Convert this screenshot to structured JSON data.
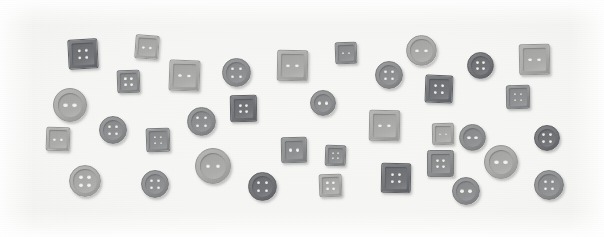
{
  "scene": {
    "title": "Assorted sewing buttons on white background",
    "width": 604,
    "height": 237,
    "background_color": "#fdfdfd",
    "surface_color": "#f6f6f4",
    "description": "Flat-lay photograph of 36 grey plastic sewing buttons, mixed round and square, each with two or four holes, scattered across a plain white surface."
  },
  "palette": {
    "dark_grey": "#6f7174",
    "mid_grey": "#8d8f90",
    "light_grey": "#a9aaa9",
    "pale_grey": "#b9b9b7",
    "hole_color": "#f2f2f0",
    "shadow": "rgba(90,90,88,0.34)"
  },
  "legend": {
    "shapes": [
      "round",
      "square"
    ],
    "hole_counts": [
      2,
      4
    ],
    "total_buttons": 36
  },
  "buttons": [
    {
      "id": "btn-01",
      "shape": "square",
      "holes": 4,
      "x": 68,
      "y": 39,
      "size": 30,
      "tone": "dark",
      "rotate": -3
    },
    {
      "id": "btn-02",
      "shape": "square",
      "holes": 2,
      "x": 135,
      "y": 35,
      "size": 24,
      "tone": "light",
      "rotate": 4
    },
    {
      "id": "btn-03",
      "shape": "square",
      "holes": 4,
      "x": 117,
      "y": 70,
      "size": 23,
      "tone": "mid",
      "rotate": -2
    },
    {
      "id": "btn-04",
      "shape": "square",
      "holes": 2,
      "x": 169,
      "y": 60,
      "size": 31,
      "tone": "light",
      "rotate": 2
    },
    {
      "id": "btn-05",
      "shape": "round",
      "holes": 4,
      "x": 222,
      "y": 58,
      "size": 29,
      "tone": "mid",
      "rotate": 0
    },
    {
      "id": "btn-06",
      "shape": "square",
      "holes": 2,
      "x": 277,
      "y": 50,
      "size": 31,
      "tone": "light",
      "rotate": 1
    },
    {
      "id": "btn-07",
      "shape": "square",
      "holes": 2,
      "x": 335,
      "y": 42,
      "size": 22,
      "tone": "mid",
      "rotate": -2
    },
    {
      "id": "btn-08",
      "shape": "round",
      "holes": 2,
      "x": 406,
      "y": 35,
      "size": 31,
      "tone": "light",
      "rotate": 0
    },
    {
      "id": "btn-09",
      "shape": "round",
      "holes": 4,
      "x": 375,
      "y": 61,
      "size": 28,
      "tone": "mid",
      "rotate": 0
    },
    {
      "id": "btn-10",
      "shape": "round",
      "holes": 4,
      "x": 467,
      "y": 52,
      "size": 27,
      "tone": "dark",
      "rotate": 0
    },
    {
      "id": "btn-11",
      "shape": "square",
      "holes": 2,
      "x": 519,
      "y": 44,
      "size": 31,
      "tone": "light",
      "rotate": -1
    },
    {
      "id": "btn-12",
      "shape": "square",
      "holes": 4,
      "x": 425,
      "y": 75,
      "size": 28,
      "tone": "dark",
      "rotate": 2
    },
    {
      "id": "btn-13",
      "shape": "square",
      "holes": 4,
      "x": 506,
      "y": 85,
      "size": 24,
      "tone": "mid",
      "rotate": -1
    },
    {
      "id": "btn-14",
      "shape": "round",
      "holes": 2,
      "x": 53,
      "y": 88,
      "size": 34,
      "tone": "light",
      "rotate": 0
    },
    {
      "id": "btn-15",
      "shape": "round",
      "holes": 4,
      "x": 187,
      "y": 107,
      "size": 29,
      "tone": "mid",
      "rotate": 0
    },
    {
      "id": "btn-16",
      "shape": "square",
      "holes": 4,
      "x": 230,
      "y": 95,
      "size": 27,
      "tone": "dark",
      "rotate": -1
    },
    {
      "id": "btn-17",
      "shape": "round",
      "holes": 2,
      "x": 310,
      "y": 90,
      "size": 26,
      "tone": "mid",
      "rotate": 0
    },
    {
      "id": "btn-18",
      "shape": "round",
      "holes": 4,
      "x": 99,
      "y": 116,
      "size": 28,
      "tone": "mid",
      "rotate": 0
    },
    {
      "id": "btn-19",
      "shape": "square",
      "holes": 2,
      "x": 46,
      "y": 127,
      "size": 24,
      "tone": "light",
      "rotate": 2
    },
    {
      "id": "btn-20",
      "shape": "square",
      "holes": 4,
      "x": 146,
      "y": 128,
      "size": 24,
      "tone": "mid",
      "rotate": -2
    },
    {
      "id": "btn-21",
      "shape": "square",
      "holes": 2,
      "x": 369,
      "y": 110,
      "size": 31,
      "tone": "light",
      "rotate": 1
    },
    {
      "id": "btn-22",
      "shape": "square",
      "holes": 2,
      "x": 432,
      "y": 123,
      "size": 22,
      "tone": "light",
      "rotate": -1
    },
    {
      "id": "btn-23",
      "shape": "round",
      "holes": 2,
      "x": 459,
      "y": 124,
      "size": 27,
      "tone": "mid",
      "rotate": 0
    },
    {
      "id": "btn-24",
      "shape": "round",
      "holes": 4,
      "x": 534,
      "y": 125,
      "size": 26,
      "tone": "dark",
      "rotate": 0
    },
    {
      "id": "btn-25",
      "shape": "round",
      "holes": 2,
      "x": 195,
      "y": 148,
      "size": 36,
      "tone": "light",
      "rotate": 0
    },
    {
      "id": "btn-26",
      "shape": "square",
      "holes": 2,
      "x": 281,
      "y": 137,
      "size": 26,
      "tone": "mid",
      "rotate": -1
    },
    {
      "id": "btn-27",
      "shape": "square",
      "holes": 4,
      "x": 325,
      "y": 145,
      "size": 21,
      "tone": "mid",
      "rotate": 2
    },
    {
      "id": "btn-28",
      "shape": "round",
      "holes": 2,
      "x": 484,
      "y": 145,
      "size": 34,
      "tone": "light",
      "rotate": 0
    },
    {
      "id": "btn-29",
      "shape": "square",
      "holes": 4,
      "x": 427,
      "y": 150,
      "size": 27,
      "tone": "mid",
      "rotate": 0
    },
    {
      "id": "btn-30",
      "shape": "round",
      "holes": 4,
      "x": 69,
      "y": 165,
      "size": 32,
      "tone": "light",
      "rotate": 0
    },
    {
      "id": "btn-31",
      "shape": "round",
      "holes": 4,
      "x": 141,
      "y": 170,
      "size": 28,
      "tone": "mid",
      "rotate": 0
    },
    {
      "id": "btn-32",
      "shape": "round",
      "holes": 4,
      "x": 248,
      "y": 172,
      "size": 29,
      "tone": "dark",
      "rotate": 0
    },
    {
      "id": "btn-33",
      "shape": "square",
      "holes": 4,
      "x": 319,
      "y": 174,
      "size": 23,
      "tone": "light",
      "rotate": -2
    },
    {
      "id": "btn-34",
      "shape": "square",
      "holes": 4,
      "x": 381,
      "y": 163,
      "size": 30,
      "tone": "dark",
      "rotate": 1
    },
    {
      "id": "btn-35",
      "shape": "round",
      "holes": 2,
      "x": 452,
      "y": 177,
      "size": 28,
      "tone": "mid",
      "rotate": 0
    },
    {
      "id": "btn-36",
      "shape": "round",
      "holes": 4,
      "x": 534,
      "y": 170,
      "size": 30,
      "tone": "mid",
      "rotate": 0
    }
  ]
}
